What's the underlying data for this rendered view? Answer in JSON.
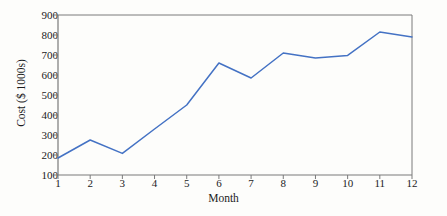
{
  "chart_data": {
    "type": "line",
    "title": "",
    "xlabel": "Month",
    "ylabel": "Cost ($ 1000s)",
    "x": [
      1,
      2,
      3,
      4,
      5,
      6,
      7,
      8,
      9,
      10,
      11,
      12
    ],
    "values": [
      185,
      275,
      208,
      330,
      450,
      660,
      585,
      710,
      685,
      698,
      815,
      790
    ],
    "series": [
      {
        "name": "Cost",
        "color": "#4472c4",
        "values": [
          185,
          275,
          208,
          330,
          450,
          660,
          585,
          710,
          685,
          698,
          815,
          790
        ]
      }
    ],
    "xlim": [
      1,
      12
    ],
    "ylim": [
      100,
      900
    ],
    "xticks": [
      1,
      2,
      3,
      4,
      5,
      6,
      7,
      8,
      9,
      10,
      11,
      12
    ],
    "xtick_labels": [
      "1",
      "2",
      "3",
      "4",
      "5",
      "6",
      "7",
      "8",
      "9",
      "10",
      "11",
      "12"
    ],
    "yticks": [
      100,
      200,
      300,
      400,
      500,
      600,
      700,
      800,
      900
    ],
    "ytick_labels": [
      "100",
      "200",
      "300",
      "400",
      "500",
      "600",
      "700",
      "800",
      "900"
    ],
    "grid": false,
    "legend": false,
    "markers": false,
    "axis_color": "#7a7a7a",
    "text_color": "#1b1b1b",
    "background": "#fdfdfb"
  }
}
